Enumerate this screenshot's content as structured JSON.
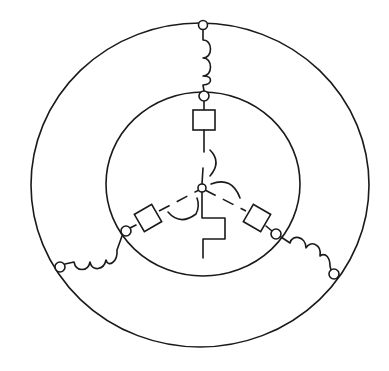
{
  "diagram": {
    "type": "three-phase star (wye) winding schematic",
    "colors": {
      "line": "#1a1a1a",
      "background": "#ffffff"
    },
    "outer_ring": {
      "cx": 200,
      "cy": 185,
      "rx": 169,
      "ry": 162
    },
    "inner_ring": {
      "cx": 203,
      "cy": 184,
      "r": 93
    },
    "neutral_node": {
      "cx": 202,
      "cy": 188,
      "r": 4
    },
    "phases": [
      {
        "id": "top",
        "outer_node": [
          203,
          25
        ],
        "inner_node": [
          204,
          96
        ],
        "element": "inductor-coil",
        "inner_element": "square-resistor"
      },
      {
        "id": "left",
        "outer_node": [
          60,
          267
        ],
        "inner_node": [
          126,
          231
        ],
        "element": "inductor-coil",
        "inner_element": "square-resistor"
      },
      {
        "id": "right",
        "outer_node": [
          334,
          274
        ],
        "inner_node": [
          276,
          234
        ],
        "element": "inductor-coil",
        "inner_element": "square-resistor"
      }
    ],
    "ground_symbol": "zigzag-stepped-ground"
  }
}
